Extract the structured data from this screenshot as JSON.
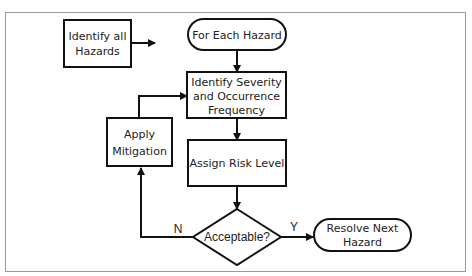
{
  "diagram": {
    "caption_fragment": "",
    "nodes": {
      "identify_hazards": {
        "line1": "Identify all",
        "line2": "Hazards"
      },
      "for_each": {
        "label": "For Each Hazard"
      },
      "identify_severity": {
        "line1": "Identify Severity",
        "line2": "and Occurrence",
        "line3": "Frequency"
      },
      "assign_risk": {
        "label": "Assign Risk Level"
      },
      "acceptable": {
        "label": "Acceptable?"
      },
      "apply_mitigation": {
        "line1": "Apply",
        "line2": "Mitigation"
      },
      "resolve_next": {
        "line1": "Resolve Next",
        "line2": "Hazard"
      }
    },
    "edges": {
      "no_label": "N",
      "yes_label": "Y"
    },
    "colors": {
      "stroke": "#111111",
      "background": "#ffffff",
      "frame": "#9a9a9a"
    }
  }
}
